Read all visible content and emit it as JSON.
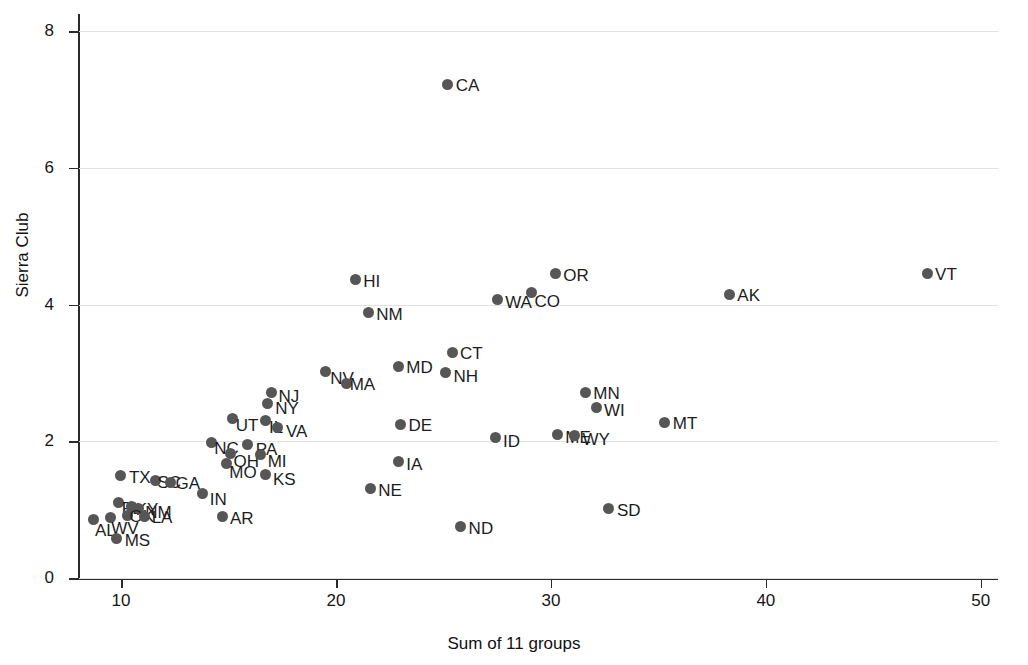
{
  "chart_data": {
    "type": "scatter",
    "title": "",
    "xlabel": "Sum of 11 groups",
    "ylabel": "Sierra Club",
    "xlim": [
      8,
      50.8
    ],
    "ylim": [
      0,
      8.25
    ],
    "xticks": [
      10,
      20,
      30,
      40,
      50
    ],
    "xticklabels": [
      "10",
      "20",
      "30",
      "40",
      "50"
    ],
    "yticks": [
      0,
      2,
      4,
      6,
      8
    ],
    "yticklabels": [
      "0",
      "2",
      "4",
      "6",
      "8"
    ],
    "grid": "horizontal",
    "legend": "none",
    "marker_color": "#565656",
    "points": [
      {
        "label": "CA",
        "x": 25.2,
        "y": 7.22,
        "lx": 8,
        "ly": -7
      },
      {
        "label": "VT",
        "x": 47.5,
        "y": 4.46,
        "lx": 8,
        "ly": -7
      },
      {
        "label": "OR",
        "x": 30.2,
        "y": 4.45,
        "lx": 8,
        "ly": -7
      },
      {
        "label": "HI",
        "x": 20.9,
        "y": 4.36,
        "lx": 8,
        "ly": -7
      },
      {
        "label": "CO",
        "x": 29.1,
        "y": 4.18,
        "lx": 3,
        "ly": 1
      },
      {
        "label": "AK",
        "x": 38.3,
        "y": 4.15,
        "lx": 8,
        "ly": -7
      },
      {
        "label": "WA",
        "x": 27.5,
        "y": 4.08,
        "lx": 8,
        "ly": -5
      },
      {
        "label": "NM",
        "x": 21.5,
        "y": 3.88,
        "lx": 8,
        "ly": -7
      },
      {
        "label": "CT",
        "x": 25.4,
        "y": 3.3,
        "lx": 8,
        "ly": -7
      },
      {
        "label": "MD",
        "x": 22.9,
        "y": 3.1,
        "lx": 8,
        "ly": -7
      },
      {
        "label": "NV",
        "x": 19.5,
        "y": 3.02,
        "lx": 5,
        "ly": -2
      },
      {
        "label": "NH",
        "x": 25.1,
        "y": 3.0,
        "lx": 8,
        "ly": -5
      },
      {
        "label": "MA",
        "x": 20.5,
        "y": 2.85,
        "lx": 3,
        "ly": 0
      },
      {
        "label": "NJ",
        "x": 17.0,
        "y": 2.72,
        "lx": 7,
        "ly": -4
      },
      {
        "label": "MN",
        "x": 31.6,
        "y": 2.72,
        "lx": 8,
        "ly": -7
      },
      {
        "label": "NY",
        "x": 16.8,
        "y": 2.55,
        "lx": 8,
        "ly": -4
      },
      {
        "label": "WI",
        "x": 32.1,
        "y": 2.5,
        "lx": 8,
        "ly": -5
      },
      {
        "label": "UT",
        "x": 15.2,
        "y": 2.33,
        "lx": 3,
        "ly": -2
      },
      {
        "label": "IL",
        "x": 16.7,
        "y": 2.3,
        "lx": 4,
        "ly": -2
      },
      {
        "label": "MT",
        "x": 35.3,
        "y": 2.28,
        "lx": 8,
        "ly": -7
      },
      {
        "label": "DE",
        "x": 23.0,
        "y": 2.25,
        "lx": 8,
        "ly": -7
      },
      {
        "label": "VA",
        "x": 17.3,
        "y": 2.2,
        "lx": 8,
        "ly": -5
      },
      {
        "label": "ME",
        "x": 30.3,
        "y": 2.1,
        "lx": 8,
        "ly": -5
      },
      {
        "label": "WY",
        "x": 31.1,
        "y": 2.08,
        "lx": 8,
        "ly": -5
      },
      {
        "label": "ID",
        "x": 27.4,
        "y": 2.05,
        "lx": 8,
        "ly": -5
      },
      {
        "label": "NC",
        "x": 14.2,
        "y": 1.98,
        "lx": 3,
        "ly": -3
      },
      {
        "label": "PA",
        "x": 15.9,
        "y": 1.95,
        "lx": 8,
        "ly": -4
      },
      {
        "label": "OH",
        "x": 15.1,
        "y": 1.82,
        "lx": 3,
        "ly": -1
      },
      {
        "label": "MI",
        "x": 16.5,
        "y": 1.8,
        "lx": 7,
        "ly": -2
      },
      {
        "label": "MO",
        "x": 14.9,
        "y": 1.68,
        "lx": 3,
        "ly": 1
      },
      {
        "label": "IA",
        "x": 22.9,
        "y": 1.7,
        "lx": 8,
        "ly": -6
      },
      {
        "label": "KS",
        "x": 16.7,
        "y": 1.52,
        "lx": 8,
        "ly": -3
      },
      {
        "label": "TX",
        "x": 10.0,
        "y": 1.5,
        "lx": 8,
        "ly": -6
      },
      {
        "label": "SC",
        "x": 11.6,
        "y": 1.42,
        "lx": 2,
        "ly": 0
      },
      {
        "label": "GA",
        "x": 12.3,
        "y": 1.4,
        "lx": 5,
        "ly": 0
      },
      {
        "label": "NE",
        "x": 21.6,
        "y": 1.31,
        "lx": 8,
        "ly": -6
      },
      {
        "label": "IN",
        "x": 13.8,
        "y": 1.24,
        "lx": 7,
        "ly": -2
      },
      {
        "label": "FL",
        "x": 9.9,
        "y": 1.1,
        "lx": 3,
        "ly": -3
      },
      {
        "label": "KY",
        "x": 10.5,
        "y": 1.05,
        "lx": 4,
        "ly": -5
      },
      {
        "label": "NM2",
        "x": 10.8,
        "y": 1.02,
        "lx": 7,
        "ly": -4
      },
      {
        "label": "SD",
        "x": 32.7,
        "y": 1.02,
        "lx": 8,
        "ly": -6
      },
      {
        "label": "OK",
        "x": 10.3,
        "y": 0.92,
        "lx": 2,
        "ly": 0
      },
      {
        "label": "LA",
        "x": 11.1,
        "y": 0.9,
        "lx": 7,
        "ly": 0
      },
      {
        "label": "AR",
        "x": 14.7,
        "y": 0.9,
        "lx": 8,
        "ly": -6
      },
      {
        "label": "WV",
        "x": 9.5,
        "y": 0.88,
        "lx": 1,
        "ly": 2
      },
      {
        "label": "AL",
        "x": 8.7,
        "y": 0.85,
        "lx": 2,
        "ly": 2
      },
      {
        "label": "ND",
        "x": 25.8,
        "y": 0.75,
        "lx": 8,
        "ly": -7
      },
      {
        "label": "MS",
        "x": 9.8,
        "y": 0.58,
        "lx": 8,
        "ly": -6
      }
    ]
  },
  "axes": {
    "y_title": "Sierra Club",
    "x_title": "Sum of 11 groups",
    "y_tick_labels": [
      "0",
      "2",
      "4",
      "6",
      "8"
    ],
    "x_tick_labels": [
      "10",
      "20",
      "30",
      "40",
      "50"
    ]
  }
}
